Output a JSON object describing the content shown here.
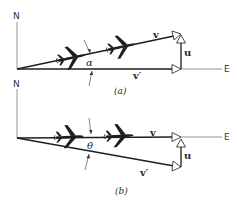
{
  "figure": {
    "panels": [
      {
        "id": "a",
        "caption": "(a)",
        "axes": {
          "north": "N",
          "east": "E"
        },
        "vectors": {
          "v": "v",
          "v_prime": "v′",
          "u": "u"
        },
        "angle_label": "α",
        "icons": [
          "airplane-icon",
          "airplane-icon"
        ]
      },
      {
        "id": "b",
        "caption": "(b)",
        "axes": {
          "north": "N",
          "east": "E"
        },
        "vectors": {
          "v": "v",
          "v_prime": "v′",
          "u": "u"
        },
        "angle_label": "θ",
        "icons": [
          "airplane-icon",
          "airplane-icon"
        ]
      }
    ],
    "colors": {
      "ink": "#1e1e1e",
      "axis": "#777777",
      "background": "#ffffff"
    }
  }
}
